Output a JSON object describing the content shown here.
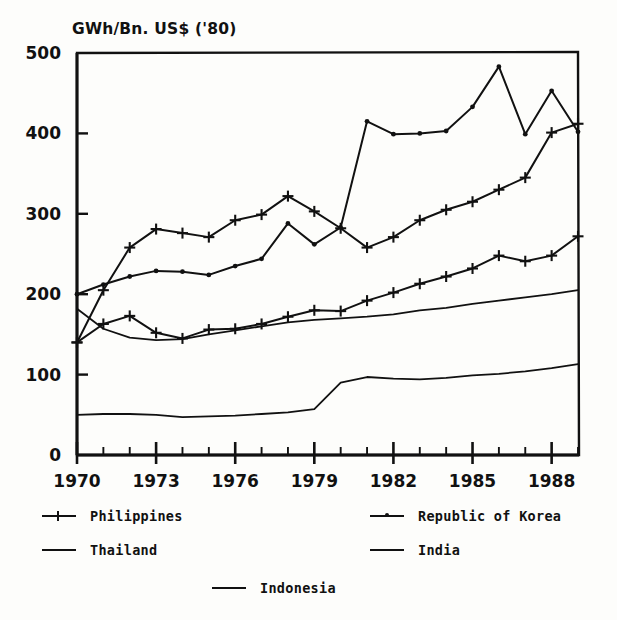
{
  "chart_data": {
    "type": "line",
    "title": "GWh/Bn. US$ ('80)",
    "xlabel": "",
    "ylabel": "GWh/Bn. US$ ('80)",
    "xlim": [
      1970,
      1989
    ],
    "ylim": [
      0,
      500
    ],
    "yticks": [
      0,
      100,
      200,
      300,
      400,
      500
    ],
    "ytick_labels": [
      "0",
      "100",
      "200",
      "300",
      "400",
      "500"
    ],
    "xticks": [
      1970,
      1973,
      1976,
      1979,
      1982,
      1985,
      1988
    ],
    "xtick_labels": [
      "1970",
      "1973",
      "1976",
      "1979",
      "1982",
      "1985",
      "1988"
    ],
    "minor_xticks": [
      1971,
      1972,
      1974,
      1975,
      1977,
      1978,
      1980,
      1981,
      1983,
      1984,
      1986,
      1987,
      1989
    ],
    "grid": false,
    "legend_position": "below",
    "x": [
      1970,
      1971,
      1972,
      1973,
      1974,
      1975,
      1976,
      1977,
      1978,
      1979,
      1980,
      1981,
      1982,
      1983,
      1984,
      1985,
      1986,
      1987,
      1988,
      1989
    ],
    "series": [
      {
        "name": "Philippines",
        "marker": "plus",
        "values": [
          140,
          205,
          258,
          281,
          276,
          271,
          292,
          299,
          322,
          303,
          282,
          258,
          271,
          292,
          305,
          315,
          330,
          345,
          401,
          412
        ]
      },
      {
        "name": "Thailand",
        "marker": "plus",
        "values": [
          140,
          163,
          173,
          152,
          145,
          156,
          157,
          163,
          172,
          180,
          179,
          192,
          202,
          213,
          222,
          232,
          248,
          241,
          248,
          272
        ]
      },
      {
        "name": "Republic of Korea",
        "marker": "dot",
        "values": [
          200,
          212,
          222,
          229,
          228,
          224,
          235,
          244,
          288,
          262,
          283,
          415,
          399,
          400,
          403,
          433,
          483,
          399,
          453,
          402
        ]
      },
      {
        "name": "India",
        "marker": "none",
        "values": [
          182,
          157,
          146,
          143,
          144,
          150,
          155,
          160,
          165,
          168,
          170,
          172,
          175,
          180,
          183,
          188,
          192,
          196,
          200,
          205
        ]
      },
      {
        "name": "Indonesia",
        "marker": "none",
        "values": [
          50,
          51,
          51,
          50,
          47,
          48,
          49,
          51,
          53,
          57,
          90,
          97,
          95,
          94,
          96,
          99,
          101,
          104,
          108,
          113
        ]
      }
    ]
  },
  "legend": {
    "items": [
      {
        "label": "Philippines",
        "marker": "plus"
      },
      {
        "label": "Thailand",
        "marker": "plus"
      },
      {
        "label": "Republic of Korea",
        "marker": "dot"
      },
      {
        "label": "India",
        "marker": "none"
      },
      {
        "label": "Indonesia",
        "marker": "none"
      }
    ]
  },
  "colors": {
    "line": "#111111",
    "axis": "#111111",
    "background": "#fdfdfb"
  }
}
